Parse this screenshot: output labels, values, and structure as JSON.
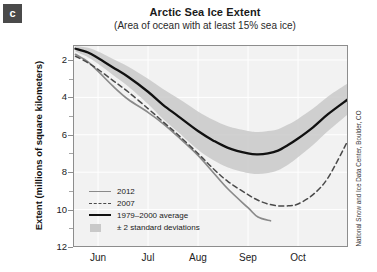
{
  "panel": {
    "label": "c"
  },
  "title": "Arctic Sea Ice Extent",
  "subtitle": "(Area of ocean with at least 15% sea ice)",
  "credit": "National Snow and Ice Data Center, Boulder, CO",
  "legend": {
    "items": [
      {
        "key": "2012-line",
        "label": "2012"
      },
      {
        "key": "2007-line",
        "label": "2007"
      },
      {
        "key": "average-line",
        "label": "1979–2000 average"
      },
      {
        "key": "stddev-band",
        "label": "± 2 standard deviations"
      }
    ]
  },
  "colors": {
    "line_2012": "#8a8a8a",
    "line_2007": "#4a4a4a",
    "line_average": "#111111",
    "band": "#c9c9c9",
    "plot_background": "#f2f2f2",
    "grid": "#ffffff",
    "axis": "#888888",
    "panel_label_bg": "#4a4a4a"
  },
  "chart_data": {
    "type": "line",
    "title": "Arctic Sea Ice Extent",
    "subtitle": "(Area of ocean with at least 15% sea ice)",
    "xlabel": "",
    "ylabel": "Extent (millions of square kilometers)",
    "ylim": [
      2,
      12.8
    ],
    "yticks": [
      2,
      4,
      6,
      8,
      10,
      12
    ],
    "yminor_ticks": [
      3,
      5,
      7,
      9,
      11
    ],
    "xlim": [
      5.5,
      11.0
    ],
    "xticks": [
      6,
      7,
      8,
      9,
      10
    ],
    "xtick_labels": [
      "Jun",
      "Jul",
      "Aug",
      "Sep",
      "Oct"
    ],
    "grid": true,
    "legend_position": "lower-left",
    "x_unit": "month-of-year (decimal)",
    "series": [
      {
        "name": "1979–2000 average",
        "style": "solid-thick-black",
        "x": [
          5.55,
          5.8,
          6.0,
          6.3,
          6.6,
          7.0,
          7.3,
          7.6,
          8.0,
          8.3,
          8.6,
          9.0,
          9.2,
          9.4,
          9.6,
          9.8,
          10.0,
          10.3,
          10.6,
          11.0
        ],
        "y": [
          12.6,
          12.4,
          12.1,
          11.6,
          11.1,
          10.3,
          9.6,
          9.0,
          8.2,
          7.7,
          7.3,
          7.0,
          6.95,
          7.0,
          7.15,
          7.45,
          7.8,
          8.4,
          9.1,
          9.9
        ]
      },
      {
        "name": "2007",
        "style": "dashed-gray",
        "x": [
          5.55,
          5.8,
          6.0,
          6.3,
          6.6,
          7.0,
          7.3,
          7.6,
          8.0,
          8.3,
          8.6,
          9.0,
          9.2,
          9.4,
          9.6,
          9.8,
          10.0,
          10.3,
          10.6,
          11.0
        ],
        "y": [
          12.2,
          11.85,
          11.5,
          10.9,
          10.3,
          9.4,
          8.7,
          8.0,
          7.0,
          6.2,
          5.5,
          4.8,
          4.5,
          4.3,
          4.2,
          4.2,
          4.3,
          4.8,
          5.7,
          7.7
        ]
      },
      {
        "name": "2012",
        "style": "solid-gray",
        "x": [
          5.55,
          5.8,
          6.0,
          6.3,
          6.6,
          7.0,
          7.3,
          7.6,
          8.0,
          8.3,
          8.6,
          9.0,
          9.2,
          9.45
        ],
        "y": [
          12.3,
          11.9,
          11.4,
          10.6,
          9.9,
          9.2,
          8.6,
          7.9,
          6.9,
          6.0,
          5.1,
          4.1,
          3.6,
          3.4
        ]
      }
    ],
    "band": {
      "name": "± 2 standard deviations",
      "around_series": "1979–2000 average",
      "x": [
        5.55,
        5.8,
        6.0,
        6.3,
        6.6,
        7.0,
        7.3,
        7.6,
        8.0,
        8.3,
        8.6,
        9.0,
        9.2,
        9.4,
        9.6,
        9.8,
        10.0,
        10.3,
        10.6,
        11.0
      ],
      "upper": [
        12.75,
        12.65,
        12.45,
        12.05,
        11.65,
        11.0,
        10.45,
        9.95,
        9.25,
        8.8,
        8.45,
        8.2,
        8.15,
        8.2,
        8.3,
        8.55,
        8.85,
        9.4,
        10.05,
        10.75
      ],
      "lower": [
        12.45,
        12.15,
        11.8,
        11.2,
        10.6,
        9.65,
        8.85,
        8.15,
        7.2,
        6.65,
        6.25,
        5.95,
        5.9,
        5.95,
        6.1,
        6.4,
        6.8,
        7.45,
        8.2,
        9.1
      ]
    }
  },
  "axes": {
    "y_labels": [
      "12",
      "10",
      "8",
      "6",
      "4",
      "2"
    ],
    "x_labels": [
      "Jun",
      "Jul",
      "Aug",
      "Sep",
      "Oct"
    ]
  }
}
